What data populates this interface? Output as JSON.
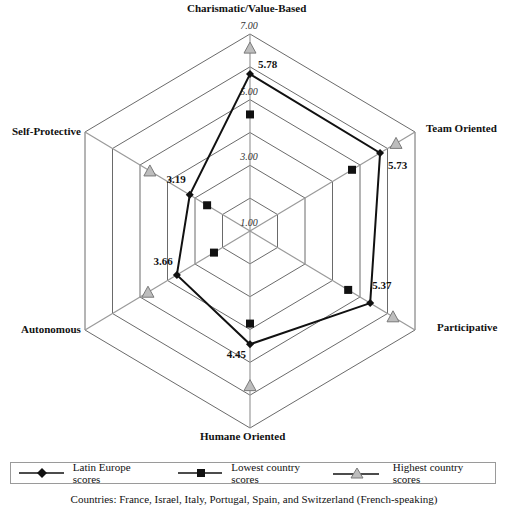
{
  "chart_data": {
    "type": "radar",
    "title": "",
    "axes": [
      "Charismatic/Value-Based",
      "Team Oriented",
      "Participative",
      "Humane Oriented",
      "Autonomous",
      "Self-Protective"
    ],
    "scale": {
      "min": 1.0,
      "max": 7.0,
      "rings": [
        2,
        3,
        4,
        5,
        6,
        7
      ],
      "tick_labels": [
        "1.00",
        "3.00",
        "5.00",
        "7.00"
      ]
    },
    "series": [
      {
        "name": "Latin Europe scores",
        "marker": "diamond",
        "values": [
          5.78,
          5.73,
          5.37,
          4.45,
          3.66,
          3.19
        ],
        "data_labels": [
          "5.78",
          "5.73",
          "5.37",
          "4.45",
          "3.66",
          "3.19"
        ]
      },
      {
        "name": "Lowest country scores",
        "marker": "square",
        "values": [
          4.55,
          4.71,
          4.57,
          3.82,
          2.31,
          2.56
        ]
      },
      {
        "name": "Highest country scores",
        "marker": "triangle",
        "values": [
          6.57,
          6.31,
          6.2,
          5.71,
          4.71,
          4.64
        ]
      }
    ],
    "legend_position": "bottom",
    "note": "Countries: France, Israel, Italy, Portugal, Spain, and Switzerland (French-speaking)"
  },
  "axis_labels": {
    "top": "Charismatic/Value-Based",
    "upper_right": "Team Oriented",
    "lower_right": "Participative",
    "bottom": "Humane Oriented",
    "lower_left": "Autonomous",
    "upper_left": "Self-Protective"
  },
  "legend": {
    "items": [
      {
        "label": "Latin Europe scores"
      },
      {
        "label": "Lowest country scores"
      },
      {
        "label": "Highest country scores"
      }
    ]
  },
  "footer": {
    "text": "Countries: France, Israel, Italy, Portugal, Spain, and Switzerland (French-speaking)"
  },
  "colors": {
    "grid": "#444444",
    "spoke": "#9a9a9a",
    "series_line": "#111111",
    "triangle_fill": "#bdbdbd",
    "triangle_stroke": "#7a7a7a"
  }
}
